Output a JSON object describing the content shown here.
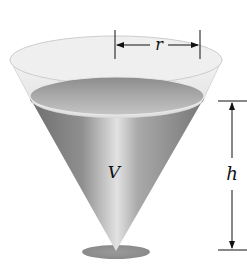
{
  "figure": {
    "labels": {
      "radius": "r",
      "volume": "V",
      "height": "h"
    },
    "colors": {
      "background": "#ffffff",
      "tank_rim": "#e6e6e6",
      "liquid_dark": "#7a7a7a",
      "liquid_light": "#d8d8d8",
      "shadow": "#8a8a8a",
      "annotation": "#111111"
    }
  }
}
